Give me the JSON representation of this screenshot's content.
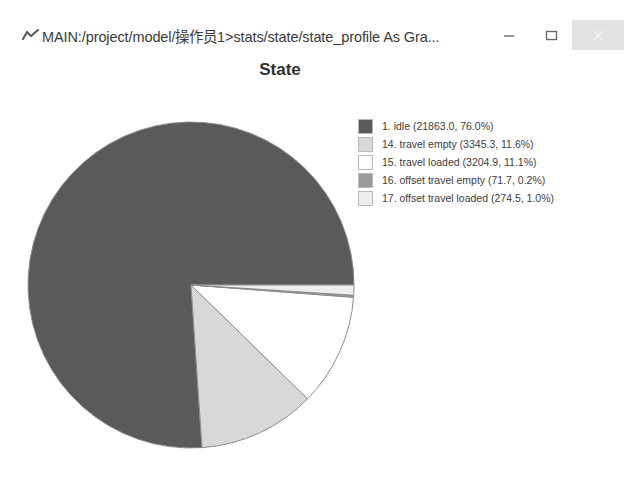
{
  "window": {
    "title": "MAIN:/project/model/操作员1>stats/state/state_profile As Gra...",
    "app_icon": "chart-icon",
    "controls": {
      "minimize_label": "Minimize",
      "maximize_label": "Maximize",
      "close_label": "Close"
    }
  },
  "chart_data": {
    "type": "pie",
    "title": "State",
    "xlabel": "",
    "ylabel": "",
    "legend_position": "right",
    "grid": false,
    "start_angle_deg": 0,
    "direction": "counterclockwise",
    "categories": [
      "1. idle",
      "14. travel empty",
      "15. travel loaded",
      "16. offset travel empty",
      "17. offset travel loaded"
    ],
    "values": [
      21863.0,
      3345.3,
      3204.9,
      71.7,
      274.5
    ],
    "percents": [
      76.0,
      11.6,
      11.1,
      0.2,
      1.0
    ],
    "colors": [
      "#5a5a5a",
      "#d8d8d8",
      "#ffffff",
      "#9a9a9a",
      "#ededed"
    ],
    "slice_border_color": "#8c8c8c",
    "legend": [
      {
        "swatch": "#5a5a5a",
        "label": "1. idle (21863.0, 76.0%)"
      },
      {
        "swatch": "#d8d8d8",
        "label": "14. travel empty (3345.3, 11.6%)"
      },
      {
        "swatch": "#ffffff",
        "label": "15. travel loaded (3204.9, 11.1%)"
      },
      {
        "swatch": "#9a9a9a",
        "label": "16. offset travel empty (71.7, 0.2%)"
      },
      {
        "swatch": "#ededed",
        "label": "17. offset travel loaded (274.5, 1.0%)"
      }
    ]
  }
}
